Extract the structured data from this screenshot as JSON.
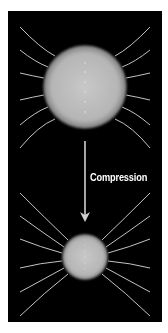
{
  "diagram": {
    "label": "Compression",
    "colors": {
      "background": "#000000",
      "page": "#ffffff",
      "field_line": "#d8d8d8",
      "sphere_center": "#c4c4c4",
      "sphere_edge": "#8a8a8a",
      "arrow": "#cfcfcf"
    },
    "before_sphere": {
      "cx": 85,
      "cy": 87,
      "r": 42
    },
    "after_sphere": {
      "cx": 85,
      "cy": 257,
      "r": 23
    },
    "arrow": {
      "x": 85,
      "y1": 141,
      "y2": 222
    }
  }
}
